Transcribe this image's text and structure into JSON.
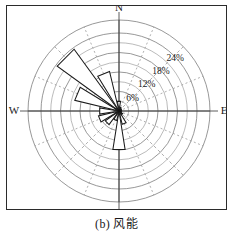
{
  "figure": {
    "caption": "(b) 风能",
    "border_color": "#2b2b2b",
    "background": "#ffffff"
  },
  "axes": {
    "north_label": "N",
    "east_label": "E",
    "south_label": "S",
    "west_label": "W",
    "axis_color": "#4a4a4a",
    "grid_color": "#7d7d7d",
    "grid_dashed_color": "#8d8d8d"
  },
  "ring_labels": [
    {
      "text": "6%",
      "value": 6
    },
    {
      "text": "12%",
      "value": 12
    },
    {
      "text": "18%",
      "value": 18
    },
    {
      "text": "24%",
      "value": 24
    }
  ],
  "chart_data": {
    "type": "bar",
    "subtype": "wind-rose",
    "title": "(b) 风能",
    "xlabel": "",
    "ylabel": "",
    "units": "%",
    "grid": true,
    "legend": false,
    "rlim": [
      0,
      28
    ],
    "rticks": [
      6,
      12,
      18,
      24
    ],
    "rtick_labels": [
      "6%",
      "12%",
      "18%",
      "24%"
    ],
    "angular_labels": [
      "N",
      "E",
      "S",
      "W"
    ],
    "categories": [
      "N",
      "NNE",
      "NE",
      "ENE",
      "E",
      "ESE",
      "SE",
      "SSE",
      "S",
      "SSW",
      "SW",
      "WSW",
      "W",
      "WNW",
      "NW",
      "NNW"
    ],
    "values": [
      3.0,
      1.2,
      0.9,
      0.8,
      0.6,
      0.8,
      1.4,
      4.2,
      12.0,
      3.0,
      5.2,
      6.5,
      6.0,
      14.0,
      23.5,
      12.5
    ],
    "series": [
      {
        "name": "风能",
        "values": [
          3.0,
          1.2,
          0.9,
          0.8,
          0.6,
          0.8,
          1.4,
          4.2,
          12.0,
          3.0,
          5.2,
          6.5,
          6.0,
          14.0,
          23.5,
          12.5
        ]
      }
    ],
    "petal_color": "#ffffff",
    "petal_edge_color": "#1a1a1a"
  }
}
